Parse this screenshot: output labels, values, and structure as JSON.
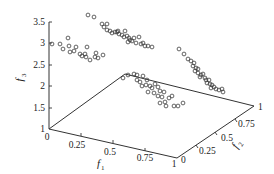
{
  "chart_data": {
    "type": "scatter",
    "projection": "3d",
    "title": "",
    "xlabel": "f1",
    "ylabel": "f2",
    "zlabel": "f3",
    "xlim": [
      0,
      1
    ],
    "ylim": [
      0,
      1
    ],
    "zlim": [
      1,
      3.5
    ],
    "grid": false,
    "legend": null,
    "x_ticks": [
      "0",
      "0.25",
      "0.5",
      "0.75",
      "1"
    ],
    "y_ticks": [
      "0",
      "0.25",
      "0.5",
      "0.75",
      "1"
    ],
    "z_ticks": [
      "1",
      "1.5",
      "2",
      "2.5",
      "3",
      "3.5"
    ],
    "marker": "open-circle",
    "series": [
      {
        "name": "cluster-left",
        "description": "points near f1≈0, f3 between ~2.6 and ~3.1",
        "screen_points": [
          [
            52,
            44
          ],
          [
            60,
            44
          ],
          [
            63,
            49
          ],
          [
            68,
            38
          ],
          [
            69,
            46
          ],
          [
            70,
            52
          ],
          [
            74,
            51
          ],
          [
            76,
            47
          ],
          [
            80,
            54
          ],
          [
            82,
            56
          ],
          [
            85,
            54
          ],
          [
            86,
            57
          ],
          [
            87,
            47
          ],
          [
            90,
            60
          ],
          [
            95,
            57
          ],
          [
            96,
            53
          ],
          [
            98,
            58
          ],
          [
            103,
            55
          ]
        ]
      },
      {
        "name": "cluster-top-diagonal",
        "description": "points from top-middle descending right, f3 ~3.5 to ~2.9",
        "screen_points": [
          [
            88,
            15
          ],
          [
            94,
            17
          ],
          [
            102,
            24
          ],
          [
            107,
            24
          ],
          [
            104,
            27
          ],
          [
            107,
            30
          ],
          [
            110,
            31
          ],
          [
            112,
            33
          ],
          [
            115,
            32
          ],
          [
            117,
            32
          ],
          [
            119,
            34
          ],
          [
            118,
            31
          ],
          [
            122,
            35
          ],
          [
            124,
            37
          ],
          [
            125,
            31
          ],
          [
            127,
            36
          ],
          [
            129,
            38
          ],
          [
            130,
            40
          ],
          [
            128,
            42
          ],
          [
            132,
            41
          ],
          [
            134,
            38
          ],
          [
            136,
            43
          ],
          [
            139,
            37
          ],
          [
            141,
            44
          ],
          [
            143,
            43
          ],
          [
            145,
            46
          ],
          [
            148,
            46
          ],
          [
            152,
            47
          ]
        ]
      },
      {
        "name": "cluster-right-diagonal",
        "description": "points descending toward f2≈1 edge",
        "screen_points": [
          [
            179,
            49
          ],
          [
            184,
            54
          ],
          [
            188,
            59
          ],
          [
            191,
            61
          ],
          [
            194,
            63
          ],
          [
            193,
            66
          ],
          [
            196,
            68
          ],
          [
            198,
            69
          ],
          [
            195,
            71
          ],
          [
            198,
            73
          ],
          [
            201,
            75
          ],
          [
            203,
            74
          ],
          [
            200,
            77
          ],
          [
            205,
            78
          ],
          [
            206,
            80
          ],
          [
            209,
            80
          ],
          [
            207,
            83
          ],
          [
            210,
            84
          ],
          [
            212,
            85
          ],
          [
            211,
            88
          ],
          [
            214,
            87
          ],
          [
            216,
            89
          ],
          [
            219,
            90
          ],
          [
            222,
            89
          ],
          [
            223,
            92
          ]
        ]
      },
      {
        "name": "cluster-center-floor",
        "description": "points near the base plane, center-right",
        "screen_points": [
          [
            123,
            78
          ],
          [
            128,
            75
          ],
          [
            134,
            74
          ],
          [
            137,
            75
          ],
          [
            137,
            80
          ],
          [
            140,
            82
          ],
          [
            143,
            76
          ],
          [
            147,
            80
          ],
          [
            142,
            86
          ],
          [
            146,
            85
          ],
          [
            150,
            86
          ],
          [
            152,
            88
          ],
          [
            155,
            84
          ],
          [
            158,
            87
          ],
          [
            148,
            92
          ],
          [
            154,
            93
          ],
          [
            158,
            96
          ],
          [
            160,
            91
          ],
          [
            164,
            92
          ],
          [
            162,
            97
          ],
          [
            165,
            102
          ],
          [
            169,
            98
          ],
          [
            172,
            96
          ],
          [
            160,
            103
          ],
          [
            166,
            106
          ],
          [
            174,
            106
          ],
          [
            178,
            106
          ],
          [
            183,
            103
          ]
        ]
      }
    ]
  },
  "labels": {
    "z_axis_title": "f",
    "z_axis_sub": "3",
    "x_axis_title": "f",
    "x_axis_sub": "1",
    "y_axis_title": "f",
    "y_axis_sub": "2",
    "z_ticks": [
      "1",
      "1.5",
      "2",
      "2.5",
      "3",
      "3.5"
    ],
    "x_ticks": [
      "0",
      "0.25",
      "0.5",
      "0.75",
      "1"
    ],
    "y_ticks": [
      "0",
      "0.25",
      "0.5",
      "0.75",
      "1"
    ]
  }
}
